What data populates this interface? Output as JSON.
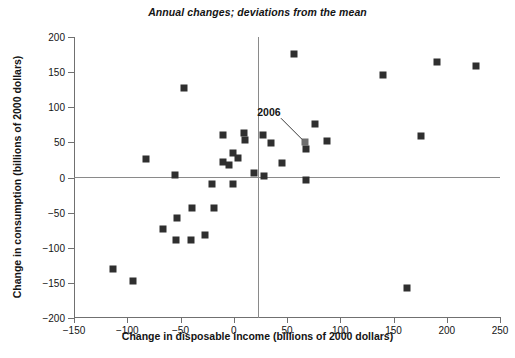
{
  "chart_data": {
    "type": "scatter",
    "title": "Annual changes; deviations from the mean",
    "xlabel": "Change in disposable income (billions of 2000 dollars)",
    "ylabel": "Change in consumption (billions of 2000 dollars)",
    "xlim": [
      -150,
      250
    ],
    "ylim": [
      -200,
      200
    ],
    "xticks": [
      -150,
      -100,
      -50,
      0,
      50,
      100,
      150,
      200,
      250
    ],
    "xtick_labels": [
      "−150",
      "−100",
      "−50",
      "0",
      "50",
      "100",
      "150",
      "200",
      "250"
    ],
    "yticks": [
      -200,
      -150,
      -100,
      -50,
      0,
      50,
      100,
      150,
      200
    ],
    "ytick_labels": [
      "−200",
      "−150",
      "−100",
      "−50",
      "0",
      "50",
      "100",
      "150",
      "200"
    ],
    "grid": false,
    "legend": null,
    "reference_lines": [
      {
        "orientation": "vertical",
        "value": 0
      },
      {
        "orientation": "horizontal",
        "value": 0
      }
    ],
    "marker_color": "#2f2f2f",
    "highlight_color": "#6e6e6e",
    "annotations": [
      {
        "text": "2006",
        "point_x": 67,
        "point_y": 50,
        "label_x": 33,
        "label_y": 93
      }
    ],
    "points": [
      {
        "x": -113,
        "y": -130
      },
      {
        "x": -95,
        "y": -147
      },
      {
        "x": -82,
        "y": 27
      },
      {
        "x": -66,
        "y": -73
      },
      {
        "x": -55,
        "y": 3
      },
      {
        "x": -54,
        "y": -89
      },
      {
        "x": -53,
        "y": -57
      },
      {
        "x": -47,
        "y": 127
      },
      {
        "x": -40,
        "y": -89
      },
      {
        "x": -39,
        "y": -43
      },
      {
        "x": -27,
        "y": -82
      },
      {
        "x": -20,
        "y": -9
      },
      {
        "x": -19,
        "y": -44
      },
      {
        "x": -10,
        "y": 61
      },
      {
        "x": -10,
        "y": 22
      },
      {
        "x": -4,
        "y": 18
      },
      {
        "x": -1,
        "y": 35
      },
      {
        "x": -1,
        "y": -9
      },
      {
        "x": 4,
        "y": 28
      },
      {
        "x": 10,
        "y": 63
      },
      {
        "x": 11,
        "y": 54
      },
      {
        "x": 19,
        "y": 6
      },
      {
        "x": 27,
        "y": 60
      },
      {
        "x": 28,
        "y": 2
      },
      {
        "x": 35,
        "y": 49
      },
      {
        "x": 45,
        "y": 20
      },
      {
        "x": 57,
        "y": 176
      },
      {
        "x": 67,
        "y": 50,
        "highlight": true
      },
      {
        "x": 68,
        "y": 40
      },
      {
        "x": 68,
        "y": -4
      },
      {
        "x": 76,
        "y": 76
      },
      {
        "x": 88,
        "y": 52
      },
      {
        "x": 140,
        "y": 146
      },
      {
        "x": 163,
        "y": -158
      },
      {
        "x": 176,
        "y": 59
      },
      {
        "x": 191,
        "y": 165
      },
      {
        "x": 227,
        "y": 159
      }
    ]
  }
}
